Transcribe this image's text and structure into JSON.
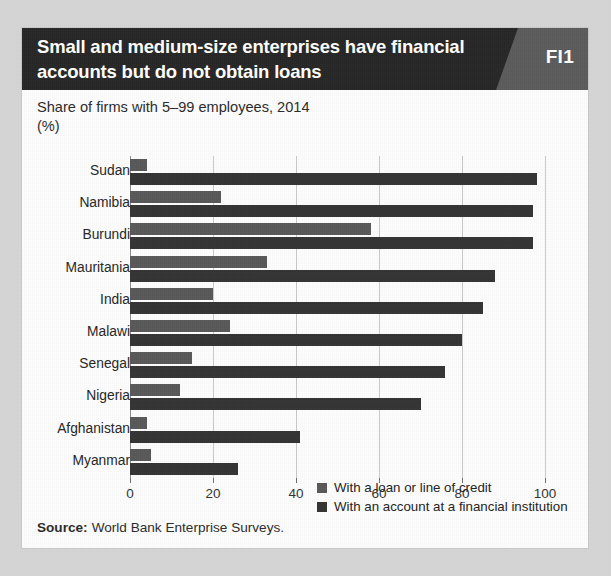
{
  "header": {
    "title": "Small and medium-size enterprises have financial accounts but do not obtain loans",
    "badge": "FI1",
    "background_color": "#262626",
    "badge_color": "#5b5b5b"
  },
  "subtitle": {
    "line1": "Share of firms with 5–99 employees, 2014",
    "line2": "(%)"
  },
  "source": {
    "label": "Source:",
    "text": "World Bank Enterprise Surveys."
  },
  "legend": {
    "position": "inside-bottom-right",
    "items": [
      {
        "label": "With a loan or line of credit",
        "color": "#585858"
      },
      {
        "label": "With an account at a financial institution",
        "color": "#343434"
      }
    ]
  },
  "chart_data": {
    "type": "bar",
    "orientation": "horizontal",
    "title": "Small and medium-size enterprises have financial accounts but do not obtain loans",
    "subtitle": "Share of firms with 5–99 employees, 2014 (%)",
    "xlabel": "",
    "ylabel": "",
    "xlim": [
      0,
      100
    ],
    "xticks": [
      0,
      20,
      40,
      60,
      80,
      100
    ],
    "xticklabels": [
      "0",
      "20",
      "40",
      "60",
      "80",
      "100"
    ],
    "grid": true,
    "grid_axis": "x",
    "categories": [
      "Sudan",
      "Namibia",
      "Burundi",
      "Mauritania",
      "India",
      "Malawi",
      "Senegal",
      "Nigeria",
      "Afghanistan",
      "Myanmar"
    ],
    "series": [
      {
        "name": "With a loan or line of credit",
        "color": "#585858",
        "values": [
          4,
          22,
          58,
          33,
          20,
          24,
          15,
          12,
          4,
          5
        ]
      },
      {
        "name": "With an account at a financial institution",
        "color": "#343434",
        "values": [
          98,
          97,
          97,
          88,
          85,
          80,
          76,
          70,
          41,
          26
        ]
      }
    ]
  }
}
